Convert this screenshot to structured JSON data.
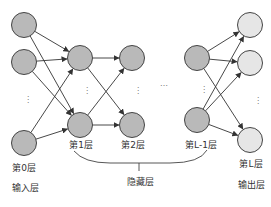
{
  "diagram": {
    "type": "fully-connected neural network",
    "colors": {
      "hidden_fill": "#b9b9b9",
      "output_fill": "#e6e6e6",
      "stroke": "#444444",
      "edge": "#333333"
    },
    "layers": [
      {
        "id": "input",
        "label": "第0层",
        "role_label": "输入层",
        "cx": 24,
        "ys": [
          25,
          62,
          143
        ],
        "fill": "#b9b9b9"
      },
      {
        "id": "layer1",
        "label": "第1层",
        "cx": 80,
        "ys": [
          58,
          125
        ],
        "fill": "#b9b9b9"
      },
      {
        "id": "layer2",
        "label": "第2层",
        "cx": 132,
        "ys": [
          58,
          125
        ],
        "fill": "#b9b9b9"
      },
      {
        "id": "layerLminus1",
        "label": "第L-1层",
        "cx": 197,
        "ys": [
          58,
          120
        ],
        "fill": "#b9b9b9"
      },
      {
        "id": "output",
        "label": "第L层",
        "role_label": "输出层",
        "cx": 250,
        "ys": [
          25,
          63,
          140
        ],
        "fill": "#e6e6e6"
      }
    ],
    "hidden_group_label": "隐藏层",
    "ellipsis_vertical": "⋮",
    "ellipsis_horizontal": "…"
  }
}
